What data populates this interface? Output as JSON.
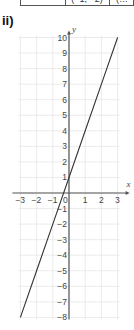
{
  "header": {
    "part_label": "ii)",
    "clipped_table": {
      "note_visible": "partial table row clipped at top edge",
      "cells": [
        "",
        "(−1, −2)",
        "(…"
      ]
    }
  },
  "chart_data": {
    "type": "line",
    "title": "",
    "xlabel": "x",
    "ylabel": "y",
    "xlim": [
      -3,
      3
    ],
    "ylim": [
      -8,
      10
    ],
    "grid": true,
    "x_ticks": [
      -3,
      -2,
      -1,
      0,
      1,
      2,
      3
    ],
    "y_ticks": [
      10,
      9,
      8,
      7,
      6,
      5,
      4,
      3,
      2,
      1,
      -1,
      -2,
      -3,
      -4,
      -5,
      -6,
      -7,
      -8
    ],
    "series": [
      {
        "name": "y = 3x + 1",
        "equation": "y = 3x + 1",
        "x": [
          -3,
          -2,
          -1,
          0,
          1,
          2,
          3
        ],
        "y": [
          -8,
          -5,
          -2,
          1,
          4,
          7,
          10
        ],
        "color": "#333333"
      }
    ],
    "legend": null
  },
  "colors": {
    "axis": "#555555",
    "grid": "#e6e6e6",
    "line": "#333333",
    "text": "#444444"
  }
}
